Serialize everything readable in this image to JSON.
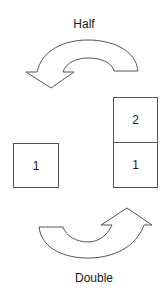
{
  "diagram": {
    "top_label": "Half",
    "bottom_label": "Double",
    "single_stack": {
      "boxes": [
        "1"
      ]
    },
    "double_stack": {
      "boxes": [
        "2",
        "1"
      ]
    },
    "top_arrow": {
      "meaning": "Half",
      "direction": "right-to-left, curving over the top"
    },
    "bottom_arrow": {
      "meaning": "Double",
      "direction": "left-to-right, curving under the bottom"
    },
    "colors": {
      "stroke": "#555555",
      "text": "#1a1a1a",
      "background": "#ffffff"
    }
  }
}
